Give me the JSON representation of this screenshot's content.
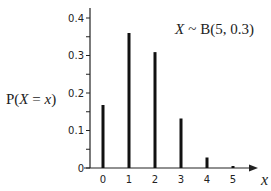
{
  "chart_data": {
    "type": "bar",
    "style": "stem",
    "title_parts": {
      "var": "X",
      "tilde": "~",
      "dist": "B(5, 0.3)"
    },
    "xlabel": "x",
    "ylabel": "P(X = x)",
    "ylabel_parts": {
      "prefix": "P(",
      "var": "X",
      "eq": " = ",
      "val": "x",
      "suffix": ")"
    },
    "categories": [
      "0",
      "1",
      "2",
      "3",
      "4",
      "5"
    ],
    "x": [
      0,
      1,
      2,
      3,
      4,
      5
    ],
    "values": [
      0.168,
      0.36,
      0.309,
      0.132,
      0.028,
      0.002
    ],
    "ylim": [
      0,
      0.42
    ],
    "yticks": [
      0,
      0.1,
      0.2,
      0.3,
      0.4
    ],
    "ytick_labels": [
      "0",
      "0.1",
      "0.2",
      "0.3",
      "0.4"
    ],
    "minor_ytick_step": 0.05,
    "grid": false,
    "legend": "none",
    "title_position": "top-right"
  }
}
